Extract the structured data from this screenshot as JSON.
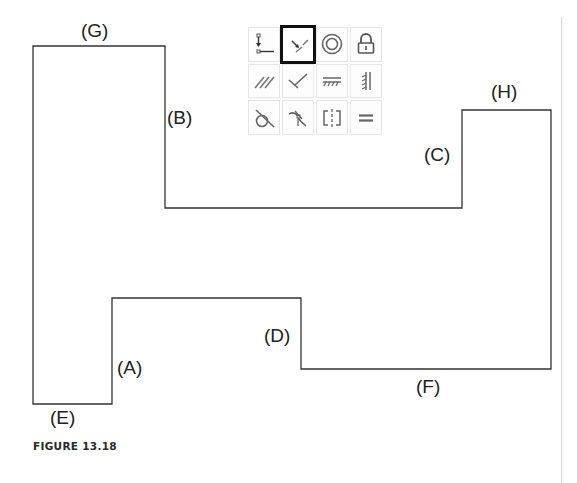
{
  "figure": {
    "caption": "FIGURE 13.18",
    "outline_color": "#333333",
    "outline_points": [
      [
        33,
        46
      ],
      [
        165,
        46
      ],
      [
        165,
        208
      ],
      [
        462,
        208
      ],
      [
        462,
        110
      ],
      [
        551,
        110
      ],
      [
        551,
        369
      ],
      [
        301,
        369
      ],
      [
        301,
        298
      ],
      [
        112,
        298
      ],
      [
        112,
        404
      ],
      [
        33,
        404
      ]
    ],
    "labels": [
      {
        "id": "G",
        "text": "(G)",
        "x": 81,
        "y": 21
      },
      {
        "id": "B",
        "text": "(B)",
        "x": 167,
        "y": 108
      },
      {
        "id": "C",
        "text": "(C)",
        "x": 424,
        "y": 145
      },
      {
        "id": "H",
        "text": "(H)",
        "x": 491,
        "y": 82
      },
      {
        "id": "D",
        "text": "(D)",
        "x": 264,
        "y": 326
      },
      {
        "id": "A",
        "text": "(A)",
        "x": 117,
        "y": 358
      },
      {
        "id": "F",
        "text": "(F)",
        "x": 416,
        "y": 377
      },
      {
        "id": "E",
        "text": "(E)",
        "x": 50,
        "y": 408
      }
    ]
  },
  "toolbar": {
    "selected_index": 1,
    "tools": [
      {
        "name": "coincident",
        "icon": "coincident-icon"
      },
      {
        "name": "collinear",
        "icon": "collinear-icon"
      },
      {
        "name": "concentric",
        "icon": "concentric-icon"
      },
      {
        "name": "fix",
        "icon": "lock-icon"
      },
      {
        "name": "parallel",
        "icon": "parallel-icon"
      },
      {
        "name": "perpendicular",
        "icon": "perpendicular-icon"
      },
      {
        "name": "horizontal",
        "icon": "horizontal-icon"
      },
      {
        "name": "vertical",
        "icon": "vertical-icon"
      },
      {
        "name": "tangent",
        "icon": "tangent-icon"
      },
      {
        "name": "smooth",
        "icon": "smooth-icon"
      },
      {
        "name": "symmetric",
        "icon": "symmetric-icon"
      },
      {
        "name": "equal",
        "icon": "equal-icon"
      }
    ]
  }
}
